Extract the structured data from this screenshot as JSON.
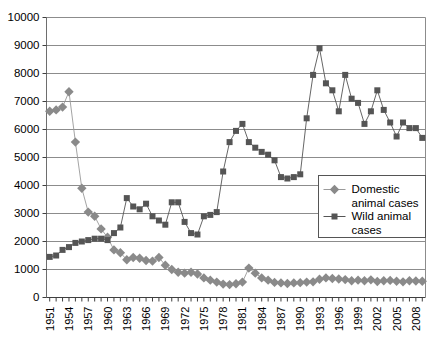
{
  "chart_data": {
    "type": "line",
    "title": "",
    "subtitle": "",
    "xlabel": "",
    "ylabel": "",
    "xlim": [
      1951,
      2009
    ],
    "ylim": [
      0,
      10000
    ],
    "ytick_step": 1000,
    "ytick_labels": [
      "0",
      "1000",
      "2000",
      "3000",
      "4000",
      "5000",
      "6000",
      "7000",
      "8000",
      "9000",
      "10000"
    ],
    "ytick_values": [
      0,
      1000,
      2000,
      3000,
      4000,
      5000,
      6000,
      7000,
      8000,
      9000,
      10000
    ],
    "x": [
      1951,
      1952,
      1953,
      1954,
      1955,
      1956,
      1957,
      1958,
      1959,
      1960,
      1961,
      1962,
      1963,
      1964,
      1965,
      1966,
      1967,
      1968,
      1969,
      1970,
      1971,
      1972,
      1973,
      1974,
      1975,
      1976,
      1977,
      1978,
      1979,
      1980,
      1981,
      1982,
      1983,
      1984,
      1985,
      1986,
      1987,
      1988,
      1989,
      1990,
      1991,
      1992,
      1993,
      1994,
      1995,
      1996,
      1997,
      1998,
      1999,
      2000,
      2001,
      2002,
      2003,
      2004,
      2005,
      2006,
      2007,
      2008,
      2009
    ],
    "xtick_labels": [
      "1951",
      "1954",
      "1957",
      "1960",
      "1963",
      "1966",
      "1969",
      "1972",
      "1975",
      "1978",
      "1981",
      "1984",
      "1987",
      "1990",
      "1993",
      "1996",
      "1999",
      "2002",
      "2005",
      "2008"
    ],
    "xtick_values": [
      1951,
      1954,
      1957,
      1960,
      1963,
      1966,
      1969,
      1972,
      1975,
      1978,
      1981,
      1984,
      1987,
      1990,
      1993,
      1996,
      1999,
      2002,
      2005,
      2008
    ],
    "xtick_rotation": -90,
    "grid": "horizontal",
    "legend_position": "inside-right",
    "series": [
      {
        "name": "Domestic animal cases",
        "marker": "diamond",
        "color": "#8a8a8a",
        "line_color": "#9a9a9a",
        "values": [
          6650,
          6700,
          6800,
          7350,
          5550,
          3900,
          3050,
          2900,
          2450,
          2150,
          1700,
          1600,
          1350,
          1430,
          1400,
          1320,
          1300,
          1430,
          1150,
          1000,
          900,
          870,
          900,
          840,
          700,
          620,
          550,
          480,
          460,
          490,
          550,
          1050,
          870,
          700,
          620,
          540,
          520,
          500,
          520,
          530,
          550,
          560,
          650,
          700,
          680,
          660,
          640,
          600,
          620,
          600,
          630,
          570,
          600,
          610,
          580,
          560,
          600,
          590,
          580
        ]
      },
      {
        "name": "Wild animal cases",
        "marker": "square",
        "color": "#555555",
        "line_color": "#555555",
        "values": [
          1450,
          1500,
          1700,
          1800,
          1950,
          2000,
          2050,
          2100,
          2100,
          2050,
          2300,
          2500,
          3550,
          3250,
          3150,
          3350,
          2900,
          2750,
          2600,
          3400,
          3400,
          2700,
          2300,
          2250,
          2900,
          2950,
          3050,
          4500,
          5550,
          5950,
          6200,
          5550,
          5350,
          5200,
          5100,
          4900,
          4300,
          4250,
          4300,
          4400,
          6400,
          7950,
          8900,
          7650,
          7400,
          6650,
          7950,
          7100,
          6950,
          6200,
          6650,
          7400,
          6700,
          6250,
          5750,
          6250,
          6050,
          6050,
          5700
        ]
      }
    ]
  },
  "legend": {
    "items": [
      {
        "label_line1": "Domestic",
        "label_line2": "animal cases",
        "marker": "diamond"
      },
      {
        "label_line1": "Wild animal",
        "label_line2": "cases",
        "marker": "square"
      }
    ]
  }
}
